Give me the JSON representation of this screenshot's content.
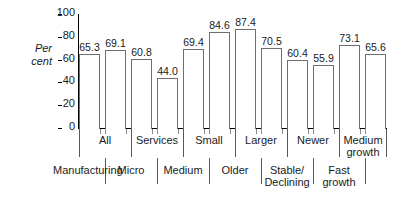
{
  "chart_data": {
    "type": "bar",
    "title": "",
    "xlabel": "",
    "ylabel": "Per\ncent",
    "ylim": [
      0,
      100
    ],
    "yticks": [
      0,
      20,
      40,
      60,
      80,
      100
    ],
    "grid": false,
    "legend": "none",
    "categories": [
      "All",
      "Manufacturing",
      "Services",
      "Micro",
      "Small",
      "Medium",
      "Larger",
      "Older",
      "Newer",
      "Stable/\nDeclining",
      "Medium\ngrowth",
      "Fast\ngrowth"
    ],
    "values": [
      65.3,
      69.1,
      60.8,
      44.0,
      69.4,
      84.6,
      87.4,
      70.5,
      60.4,
      55.9,
      73.1,
      65.6
    ],
    "value_labels": [
      "65.3",
      "69.1",
      "60.8",
      "44.0",
      "69.4",
      "84.6",
      "87.4",
      "70.5",
      "60.4",
      "55.9",
      "73.1",
      "65.6"
    ],
    "bar_fill": "#ffffff",
    "bar_border": "#6e6e6e",
    "axis_color": "#000000",
    "label_rows": {
      "top": [
        "All",
        "Services",
        "Small",
        "Larger",
        "Newer",
        "Medium\ngrowth"
      ],
      "bottom": [
        "Manufacturing",
        "Micro",
        "Medium",
        "Older",
        "Stable/\nDeclining",
        "Fast\ngrowth"
      ]
    }
  },
  "axis": {
    "y_title": "Per\ncent",
    "ticks": [
      "100",
      "80",
      "60",
      "40",
      "20",
      "0"
    ]
  },
  "values": {
    "v0": "65.3",
    "v1": "69.1",
    "v2": "60.8",
    "v3": "44.0",
    "v4": "69.4",
    "v5": "84.6",
    "v6": "87.4",
    "v7": "70.5",
    "v8": "60.4",
    "v9": "55.9",
    "v10": "73.1",
    "v11": "65.6"
  },
  "labels": {
    "top": {
      "l0": "All",
      "l1": "Services",
      "l2": "Small",
      "l3": "Larger",
      "l4": "Newer",
      "l5": "Medium\ngrowth"
    },
    "bottom": {
      "l0": "Manufacturing",
      "l1": "Micro",
      "l2": "Medium",
      "l3": "Older",
      "l4": "Stable/\nDeclining",
      "l5": "Fast\ngrowth"
    }
  }
}
